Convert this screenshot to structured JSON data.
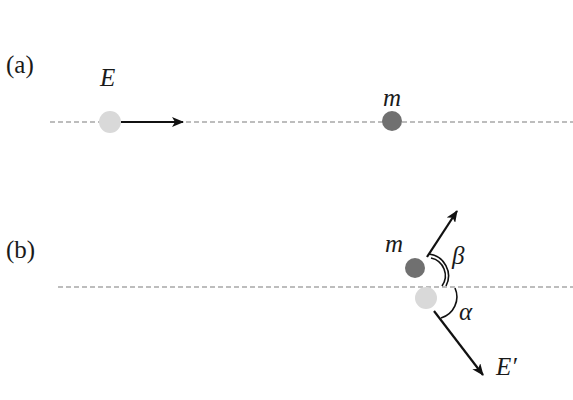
{
  "panels": [
    {
      "label": "(a)",
      "incoming_particle_label": "E",
      "target_particle_label": "m"
    },
    {
      "label": "(b)",
      "recoil_particle_label": "m",
      "scattered_particle_label": "E′",
      "recoil_angle_label": "β",
      "scatter_angle_label": "α"
    }
  ],
  "colors": {
    "light_particle": "#d9d9d9",
    "dark_particle": "#707070",
    "dashed_line": "#a8a8a8",
    "arrow": "#111111"
  }
}
